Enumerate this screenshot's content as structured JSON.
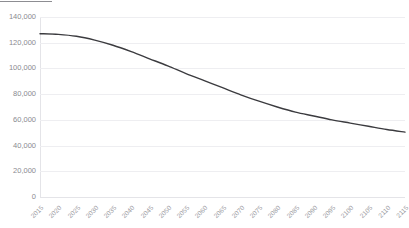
{
  "chart_data": {
    "type": "line",
    "title": "",
    "xlabel": "",
    "ylabel": "",
    "x": [
      2015,
      2020,
      2025,
      2030,
      2035,
      2040,
      2045,
      2050,
      2055,
      2060,
      2065,
      2070,
      2075,
      2080,
      2085,
      2090,
      2095,
      2100,
      2105,
      2110,
      2115
    ],
    "categories": [
      "2015",
      "2020",
      "2025",
      "2030",
      "2035",
      "2040",
      "2045",
      "2050",
      "2055",
      "2060",
      "2065",
      "2070",
      "2075",
      "2080",
      "2085",
      "2090",
      "2095",
      "2100",
      "2105",
      "2110",
      "2115"
    ],
    "values": [
      127000,
      126500,
      125000,
      122000,
      118000,
      113000,
      107500,
      102000,
      96000,
      90500,
      85000,
      79500,
      74500,
      70000,
      66000,
      63000,
      60000,
      57500,
      55000,
      52500,
      50500
    ],
    "series": [
      {
        "name": "Population",
        "values": [
          127000,
          126500,
          125000,
          122000,
          118000,
          113000,
          107500,
          102000,
          96000,
          90500,
          85000,
          79500,
          74500,
          70000,
          66000,
          63000,
          60000,
          57500,
          55000,
          52500,
          50500
        ],
        "color": "#3b3b3f"
      }
    ],
    "ylim": [
      0,
      140000
    ],
    "xlim": [
      2015,
      2115
    ],
    "yticks": [
      0,
      20000,
      40000,
      60000,
      80000,
      100000,
      120000,
      140000
    ],
    "ytick_labels": [
      "0",
      "20,000",
      "40,000",
      "60,000",
      "80,000",
      "100,000",
      "120,000",
      "140,000"
    ],
    "grid": true,
    "legend": false,
    "legend_position": "none"
  },
  "style": {
    "line_color": "#3b3b3f",
    "grid_color": "#eeeef1",
    "axis_color": "#e4e4e8",
    "tick_label_color": "#8a8a8f",
    "plot_background": "#ffffff"
  },
  "header": {
    "cropped_title": ""
  }
}
